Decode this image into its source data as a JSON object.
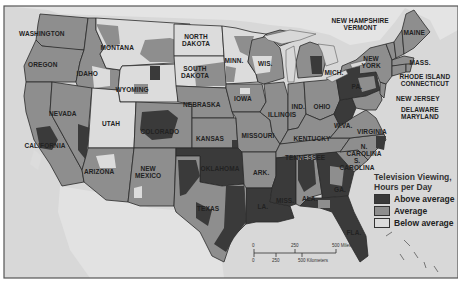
{
  "map": {
    "title": "Television Viewing, Hours per Day",
    "colors": {
      "above_average": "#3a3a3a",
      "average": "#8e8e8e",
      "below_average": "#dcdcdc",
      "water": "#d6d6d6",
      "border": "#2a2a2a",
      "frame": "#555555"
    },
    "state_labels": [
      {
        "id": "washington",
        "text": "WASHINGTON",
        "x": 42,
        "y": 33
      },
      {
        "id": "oregon",
        "text": "OREGON",
        "x": 43,
        "y": 64
      },
      {
        "id": "idaho",
        "text": "IDAHO",
        "x": 87,
        "y": 73
      },
      {
        "id": "montana",
        "text": "MONTANA",
        "x": 117,
        "y": 47
      },
      {
        "id": "wyoming",
        "text": "WYOMING",
        "x": 132,
        "y": 89
      },
      {
        "id": "nevada",
        "text": "NEVADA",
        "x": 63,
        "y": 113
      },
      {
        "id": "utah",
        "text": "UTAH",
        "x": 111,
        "y": 123
      },
      {
        "id": "colorado",
        "text": "COLORADO",
        "x": 160,
        "y": 131
      },
      {
        "id": "california",
        "text": "CALIFORNIA",
        "x": 45,
        "y": 145
      },
      {
        "id": "arizona",
        "text": "ARIZONA",
        "x": 99,
        "y": 171
      },
      {
        "id": "new-mexico",
        "text": "NEW\nMEXICO",
        "x": 148,
        "y": 172
      },
      {
        "id": "north-dakota",
        "text": "NORTH\nDAKOTA",
        "x": 196,
        "y": 40
      },
      {
        "id": "south-dakota",
        "text": "SOUTH\nDAKOTA",
        "x": 195,
        "y": 72
      },
      {
        "id": "nebraska",
        "text": "NEBRASKA",
        "x": 202,
        "y": 104
      },
      {
        "id": "kansas",
        "text": "KANSAS",
        "x": 210,
        "y": 138
      },
      {
        "id": "oklahoma",
        "text": "OKLAHOMA",
        "x": 220,
        "y": 168
      },
      {
        "id": "texas",
        "text": "TEXAS",
        "x": 208,
        "y": 208
      },
      {
        "id": "minn",
        "text": "MINN.",
        "x": 234,
        "y": 60
      },
      {
        "id": "iowa",
        "text": "IOWA",
        "x": 243,
        "y": 98
      },
      {
        "id": "missouri",
        "text": "MISSOURI",
        "x": 258,
        "y": 135
      },
      {
        "id": "ark",
        "text": "ARK.",
        "x": 261,
        "y": 172
      },
      {
        "id": "wis",
        "text": "WIS.",
        "x": 265,
        "y": 63
      },
      {
        "id": "illinois",
        "text": "ILLINOIS",
        "x": 282,
        "y": 114
      },
      {
        "id": "ind",
        "text": "IND.",
        "x": 298,
        "y": 106
      },
      {
        "id": "ohio",
        "text": "OHIO",
        "x": 322,
        "y": 106
      },
      {
        "id": "kentucky",
        "text": "KENTUCKY",
        "x": 312,
        "y": 138
      },
      {
        "id": "tennessee",
        "text": "TENNESSEE",
        "x": 305,
        "y": 157
      },
      {
        "id": "miss",
        "text": "MISS.",
        "x": 285,
        "y": 200
      },
      {
        "id": "la",
        "text": "LA.",
        "x": 263,
        "y": 206
      },
      {
        "id": "ala",
        "text": "ALA.",
        "x": 310,
        "y": 198
      },
      {
        "id": "ga",
        "text": "GA.",
        "x": 340,
        "y": 189
      },
      {
        "id": "fla",
        "text": "FLA.",
        "x": 354,
        "y": 232
      },
      {
        "id": "s-carolina",
        "text": "S.\nCAROLINA",
        "x": 357,
        "y": 164
      },
      {
        "id": "n-carolina",
        "text": "N.\nCAROLINA",
        "x": 364,
        "y": 150
      },
      {
        "id": "virginia",
        "text": "VIRGINIA",
        "x": 372,
        "y": 131
      },
      {
        "id": "pa",
        "text": "PA.",
        "x": 357,
        "y": 86
      },
      {
        "id": "w-va",
        "text": "W.VA.",
        "x": 343,
        "y": 125
      },
      {
        "id": "new-york",
        "text": "NEW\nYORK",
        "x": 371,
        "y": 62
      },
      {
        "id": "maine",
        "text": "MAINE",
        "x": 414,
        "y": 32
      },
      {
        "id": "new-hampshire-vermont",
        "text": "NEW HAMPSHIRE\nVERMONT",
        "x": 360,
        "y": 24
      },
      {
        "id": "mass",
        "text": "MASS.",
        "x": 420,
        "y": 62
      },
      {
        "id": "rhode-island-connecticut",
        "text": "RHODE ISLAND\nCONNECTICUT",
        "x": 425,
        "y": 80
      },
      {
        "id": "new-jersey",
        "text": "NEW JERSEY",
        "x": 418,
        "y": 98
      },
      {
        "id": "delaware-maryland",
        "text": "DELAWARE\nMARYLAND",
        "x": 420,
        "y": 113
      },
      {
        "id": "mich",
        "text": "MICH.",
        "x": 334,
        "y": 72
      }
    ],
    "legend": {
      "title_line1": "Television Viewing,",
      "title_line2": "Hours per Day",
      "items": [
        {
          "label": "Above average",
          "color": "#3a3a3a"
        },
        {
          "label": "Average",
          "color": "#8e8e8e"
        },
        {
          "label": "Below average",
          "color": "#dcdcdc"
        }
      ]
    },
    "scale": {
      "miles_ticks": [
        "0",
        "250",
        "500 Miles"
      ],
      "km_ticks": [
        "0",
        "250",
        "500 Kilometers"
      ]
    }
  }
}
